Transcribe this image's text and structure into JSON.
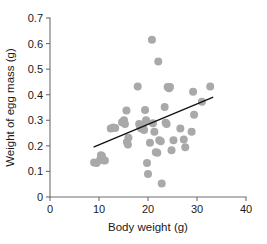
{
  "chart_data": {
    "type": "scatter",
    "title": "",
    "xlabel": "Body weight (g)",
    "ylabel": "Weight of egg mass (g)",
    "xlim": [
      0,
      40
    ],
    "ylim": [
      0,
      0.7
    ],
    "xticks": [
      0,
      10,
      20,
      30,
      40
    ],
    "yticks": [
      0,
      0.1,
      0.2,
      0.3,
      0.4,
      0.5,
      0.6,
      0.7
    ],
    "xtick_labels": [
      "0",
      "10",
      "20",
      "30",
      "40"
    ],
    "ytick_labels": [
      "0",
      "0.1",
      "0.2",
      "0.3",
      "0.4",
      "0.5",
      "0.6",
      "0.7"
    ],
    "grid": false,
    "legend": null,
    "marker_color": "#a9a9a9",
    "marker_size": 5.2,
    "points": [
      {
        "x": 9.0,
        "y": 0.135
      },
      {
        "x": 9.5,
        "y": 0.133
      },
      {
        "x": 10.2,
        "y": 0.145
      },
      {
        "x": 10.4,
        "y": 0.163
      },
      {
        "x": 10.6,
        "y": 0.16
      },
      {
        "x": 10.9,
        "y": 0.144
      },
      {
        "x": 11.2,
        "y": 0.143
      },
      {
        "x": 12.4,
        "y": 0.268
      },
      {
        "x": 12.9,
        "y": 0.272
      },
      {
        "x": 13.3,
        "y": 0.27
      },
      {
        "x": 14.7,
        "y": 0.292
      },
      {
        "x": 15.1,
        "y": 0.3
      },
      {
        "x": 15.3,
        "y": 0.285
      },
      {
        "x": 15.6,
        "y": 0.338
      },
      {
        "x": 15.7,
        "y": 0.215
      },
      {
        "x": 15.9,
        "y": 0.205
      },
      {
        "x": 16.0,
        "y": 0.232
      },
      {
        "x": 17.9,
        "y": 0.432
      },
      {
        "x": 18.2,
        "y": 0.285
      },
      {
        "x": 18.4,
        "y": 0.275
      },
      {
        "x": 18.6,
        "y": 0.268
      },
      {
        "x": 18.8,
        "y": 0.282
      },
      {
        "x": 19.0,
        "y": 0.272
      },
      {
        "x": 19.2,
        "y": 0.262
      },
      {
        "x": 19.4,
        "y": 0.34
      },
      {
        "x": 19.6,
        "y": 0.3
      },
      {
        "x": 19.8,
        "y": 0.133
      },
      {
        "x": 20.0,
        "y": 0.09
      },
      {
        "x": 20.4,
        "y": 0.212
      },
      {
        "x": 20.8,
        "y": 0.615
      },
      {
        "x": 21.0,
        "y": 0.288
      },
      {
        "x": 21.3,
        "y": 0.255
      },
      {
        "x": 21.6,
        "y": 0.175
      },
      {
        "x": 21.9,
        "y": 0.173
      },
      {
        "x": 22.1,
        "y": 0.53
      },
      {
        "x": 22.3,
        "y": 0.222
      },
      {
        "x": 22.6,
        "y": 0.218
      },
      {
        "x": 22.8,
        "y": 0.053
      },
      {
        "x": 23.4,
        "y": 0.352
      },
      {
        "x": 23.6,
        "y": 0.29
      },
      {
        "x": 23.8,
        "y": 0.285
      },
      {
        "x": 24.0,
        "y": 0.43
      },
      {
        "x": 24.3,
        "y": 0.425
      },
      {
        "x": 24.5,
        "y": 0.43
      },
      {
        "x": 24.8,
        "y": 0.183
      },
      {
        "x": 25.2,
        "y": 0.222
      },
      {
        "x": 26.6,
        "y": 0.268
      },
      {
        "x": 27.3,
        "y": 0.225
      },
      {
        "x": 27.6,
        "y": 0.195
      },
      {
        "x": 28.9,
        "y": 0.255
      },
      {
        "x": 29.2,
        "y": 0.412
      },
      {
        "x": 29.4,
        "y": 0.322
      },
      {
        "x": 31.0,
        "y": 0.372
      },
      {
        "x": 32.7,
        "y": 0.432
      }
    ],
    "fit_line": {
      "x_start": 9.0,
      "y_start": 0.196,
      "x_end": 33.2,
      "y_end": 0.39,
      "color": "#111111"
    }
  }
}
